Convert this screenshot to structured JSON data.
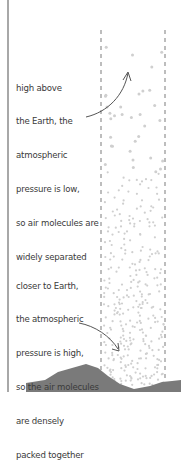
{
  "diagram": {
    "top_annotation": {
      "lines": [
        "high above",
        "the Earth, the",
        "atmospheric",
        "pressure is low,",
        "so air molecules are",
        "widely separated"
      ]
    },
    "bottom_annotation": {
      "lines": [
        "closer to Earth,",
        "the atmospheric",
        "pressure is high,",
        "so the air molecules",
        "are densely",
        "packed together"
      ]
    },
    "colors": {
      "text": "#3a3a3a",
      "dashed_column": "#9a9a9a",
      "molecule_dots": "#cfcfcf",
      "ground": "#7a7a7a",
      "arrow": "#555555",
      "left_border": "#a8a8a8"
    },
    "elements": {
      "column": "air column (dashed outline)",
      "ground": "Earth surface / hills",
      "arrows": [
        "arrow pointing to sparse molecules",
        "arrow pointing to dense molecules"
      ]
    }
  }
}
